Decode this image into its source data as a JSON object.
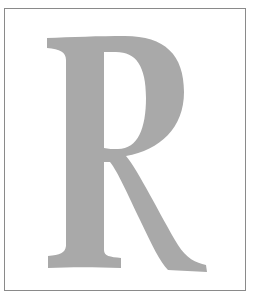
{
  "figure": {
    "letter": "R",
    "fill_color": "#a9a9a9",
    "border_color": "#8a8a8a",
    "background": "#ffffff"
  }
}
